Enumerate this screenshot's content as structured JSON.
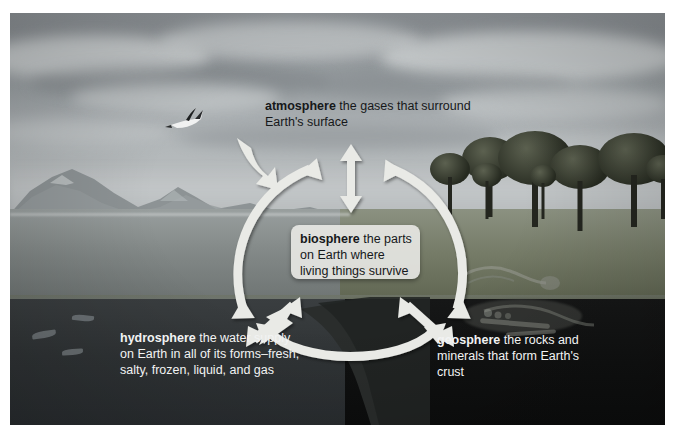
{
  "figure": {
    "kind": "earth-systems-diagram",
    "border_color": "#ffffff",
    "arrow_color": "#e9eae6"
  },
  "labels": {
    "atmosphere": {
      "term": "atmosphere",
      "definition": "the gases that surround Earth's surface",
      "text_color": "#16181a"
    },
    "biosphere": {
      "term": "biosphere",
      "definition": "the parts on Earth where living things survive",
      "text_color": "#16181a",
      "box_color": "#e9e9e6"
    },
    "hydrosphere": {
      "term": "hydrosphere",
      "definition": "the water supply on Earth in all of its forms–fresh, salty, frozen, liquid, and gas",
      "text_color": "#f2f3f3"
    },
    "geosphere": {
      "term": "geosphere",
      "definition": "the rocks and minerals that form Earth's crust",
      "text_color": "#f2f3f3"
    }
  },
  "arrows": {
    "top_vertical": "double-headed-vertical-arrow",
    "left_curve": "curved-double-headed-arrow-left",
    "right_curve": "curved-double-headed-arrow-right",
    "bottom_curve": "curved-double-headed-arrow-bottom",
    "bottom_left_diagonal": "double-headed-diagonal-arrow-lower-left",
    "bottom_right_diagonal": "double-headed-diagonal-arrow-lower-right"
  },
  "scene": {
    "sky": "overcast-cloudy-sky",
    "bird": "flying-bird",
    "mountains": "distant-mountain-range",
    "lake": "lake-surface",
    "trees": "tree-grove",
    "underwater": "underwater-fish",
    "subsurface": "buried-fossils-and-rock-layers"
  }
}
